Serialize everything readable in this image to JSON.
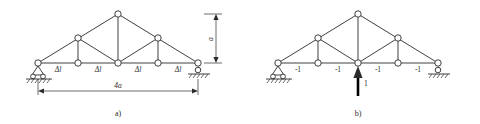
{
  "figure": {
    "panels": [
      {
        "id": "a",
        "caption": "a)",
        "geometry": {
          "bottom_chord_nodes_x": [
            38,
            78,
            118,
            158,
            198
          ],
          "bottom_chord_y": 63,
          "top_nodes": [
            {
              "x": 78,
              "y": 38
            },
            {
              "x": 118,
              "y": 14
            },
            {
              "x": 158,
              "y": 38
            }
          ],
          "node_radius": 3.2
        },
        "member_labels": [
          {
            "text": "Δl",
            "x": 58,
            "y": 72
          },
          {
            "text": "Δl",
            "x": 98,
            "y": 72
          },
          {
            "text": "Δl",
            "x": 138,
            "y": 72
          },
          {
            "text": "Δl",
            "x": 178,
            "y": 72
          }
        ],
        "dimensions": [
          {
            "name": "height-dimension",
            "text": "a",
            "x": 213,
            "y": 38
          },
          {
            "name": "span-dimension",
            "text": "4a",
            "x": 118,
            "y": 88
          }
        ],
        "supports": [
          {
            "type": "pin-support",
            "x": 38,
            "y": 63
          },
          {
            "type": "roller-support",
            "x": 198,
            "y": 63
          }
        ]
      },
      {
        "id": "b",
        "caption": "b)",
        "geometry": {
          "bottom_chord_nodes_x": [
            278,
            318,
            358,
            398,
            438
          ],
          "bottom_chord_y": 63,
          "top_nodes": [
            {
              "x": 318,
              "y": 38
            },
            {
              "x": 358,
              "y": 14
            },
            {
              "x": 398,
              "y": 38
            }
          ],
          "node_radius": 3.2
        },
        "member_labels": [
          {
            "text": "-1",
            "x": 298,
            "y": 72
          },
          {
            "text": "-1",
            "x": 338,
            "y": 72
          },
          {
            "text": "-1",
            "x": 378,
            "y": 72
          },
          {
            "text": "-1",
            "x": 418,
            "y": 72
          }
        ],
        "load": {
          "name": "unit-load-arrow",
          "text": "1",
          "label_x": 364,
          "label_y": 84,
          "x": 358,
          "tail_y": 96,
          "head_y": 66,
          "direction": "up"
        },
        "supports": [
          {
            "type": "pin-support",
            "x": 278,
            "y": 63
          },
          {
            "type": "roller-support",
            "x": 438,
            "y": 63
          }
        ]
      }
    ]
  }
}
